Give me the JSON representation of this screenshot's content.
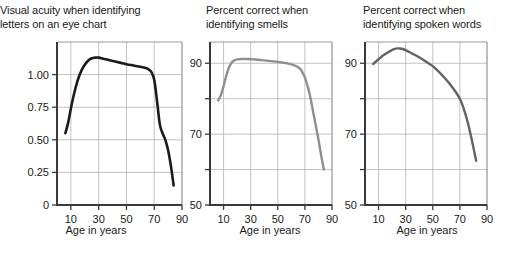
{
  "figure": {
    "background": "#ffffff",
    "width": 512,
    "height": 258
  },
  "chart_data": [
    {
      "type": "line",
      "panel_index": 0,
      "title": "Visual acuity when identifying\nletters on an eye chart",
      "xlabel": "Age in years",
      "ylabel": "",
      "xlim": [
        0,
        90
      ],
      "ylim": [
        0,
        1.25
      ],
      "xticks": [
        10,
        30,
        50,
        70,
        90
      ],
      "xtick_labels": [
        "10",
        "30",
        "50",
        "70",
        "90"
      ],
      "yticks": [
        0,
        0.25,
        0.5,
        0.75,
        1.0
      ],
      "ytick_labels": [
        "0",
        "0.25",
        "0.50",
        "0.75",
        "1.00"
      ],
      "grid": true,
      "grid_color": "#b4b4b4",
      "legend": "none",
      "line_color": "#1a1a1a",
      "line_width": 2.6,
      "x": [
        6,
        8,
        10,
        12,
        15,
        18,
        21,
        24,
        27,
        30,
        34,
        38,
        42,
        46,
        50,
        55,
        60,
        64,
        66,
        68,
        70,
        72,
        74,
        76,
        78,
        80,
        82,
        84
      ],
      "values": [
        0.55,
        0.63,
        0.74,
        0.84,
        0.96,
        1.04,
        1.09,
        1.12,
        1.13,
        1.13,
        1.12,
        1.11,
        1.1,
        1.09,
        1.08,
        1.07,
        1.06,
        1.05,
        1.04,
        1.02,
        0.96,
        0.8,
        0.62,
        0.55,
        0.5,
        0.42,
        0.3,
        0.15
      ]
    },
    {
      "type": "line",
      "panel_index": 1,
      "title": "Percent correct when\nidentifying smells",
      "xlabel": "Age in years",
      "ylabel": "",
      "xlim": [
        0,
        90
      ],
      "ylim": [
        50,
        96
      ],
      "xticks": [
        10,
        30,
        50,
        70,
        90
      ],
      "xtick_labels": [
        "10",
        "30",
        "50",
        "70",
        "90"
      ],
      "yticks": [
        50,
        60,
        70,
        80,
        90
      ],
      "ytick_labels": [
        "50",
        "",
        "70",
        "",
        "90"
      ],
      "grid": true,
      "grid_color": "#b4b4b4",
      "legend": "none",
      "line_color": "#8f8f8f",
      "line_width": 2.4,
      "x": [
        6,
        8,
        10,
        12,
        14,
        16,
        18,
        20,
        24,
        28,
        32,
        36,
        40,
        45,
        50,
        55,
        60,
        63,
        66,
        68,
        70,
        72,
        74,
        76,
        78,
        80,
        82,
        84
      ],
      "values": [
        79.5,
        81.0,
        83.5,
        86.5,
        88.8,
        90.2,
        90.8,
        91.1,
        91.2,
        91.2,
        91.1,
        91.0,
        90.8,
        90.6,
        90.4,
        90.1,
        89.7,
        89.3,
        88.6,
        87.6,
        86.0,
        83.5,
        80.5,
        76.5,
        72.5,
        68.5,
        64.0,
        60.0
      ]
    },
    {
      "type": "line",
      "panel_index": 2,
      "title": "Percent correct when\nidentifying spoken words",
      "xlabel": "Age in years",
      "ylabel": "",
      "xlim": [
        0,
        90
      ],
      "ylim": [
        50,
        96
      ],
      "xticks": [
        10,
        30,
        50,
        70,
        90
      ],
      "xtick_labels": [
        "10",
        "30",
        "50",
        "70",
        "90"
      ],
      "yticks": [
        50,
        60,
        70,
        80,
        90
      ],
      "ytick_labels": [
        "50",
        "",
        "70",
        "",
        "90"
      ],
      "grid": true,
      "grid_color": "#b4b4b4",
      "legend": "none",
      "line_color": "#636363",
      "line_width": 2.4,
      "x": [
        6,
        9,
        12,
        15,
        18,
        21,
        24,
        27,
        30,
        34,
        38,
        42,
        46,
        50,
        54,
        58,
        62,
        66,
        70,
        73,
        76,
        79,
        82
      ],
      "values": [
        89.8,
        90.8,
        91.8,
        92.6,
        93.3,
        93.9,
        94.2,
        94.1,
        93.7,
        92.9,
        92.1,
        91.2,
        90.2,
        89.2,
        87.8,
        86.2,
        84.4,
        82.4,
        80.0,
        77.0,
        73.0,
        68.0,
        62.5
      ]
    }
  ]
}
